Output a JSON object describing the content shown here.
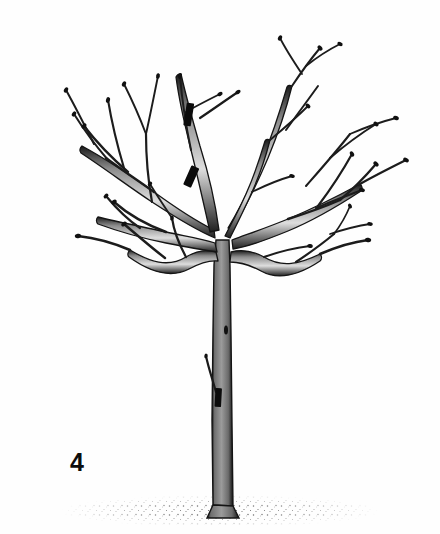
{
  "figure": {
    "number": "4",
    "caption": "",
    "width": 440,
    "height": 534
  },
  "colors": {
    "background": "#fefefe",
    "outline": "#141414",
    "trunk_fill": "#8a8a8a",
    "trunk_fill_light": "#9d9d9d",
    "branch_fill": "#f2f2f2",
    "cut_mark": "#0b0b0b",
    "ground_stipple": "#3a3a3a",
    "label_text": "#0d0d0d"
  },
  "elements": {
    "trunk_label": "tree trunk",
    "scaffold_label": "scaffold branches",
    "ground_label": "ground line",
    "cut_mark_label": "pruning cut mark",
    "sucker_label": "trunk sucker shoot"
  },
  "cut_marks": [
    {
      "id": "cut-upper-leader",
      "x": 188,
      "y": 104,
      "w": 7,
      "h": 22,
      "angle": 8
    },
    {
      "id": "cut-mid-scaffold",
      "x": 190,
      "y": 172,
      "w": 8,
      "h": 20,
      "angle": 22
    },
    {
      "id": "cut-trunk-sucker",
      "x": 218,
      "y": 390,
      "w": 6,
      "h": 18,
      "angle": 4
    }
  ],
  "removed_stubs": [
    {
      "id": "stub-upper-right",
      "x1": 200,
      "y1": 118,
      "x2": 238,
      "y2": 92
    },
    {
      "id": "stub-trunk-low",
      "x1": 212,
      "y1": 390,
      "x2": 206,
      "y2": 358
    }
  ]
}
